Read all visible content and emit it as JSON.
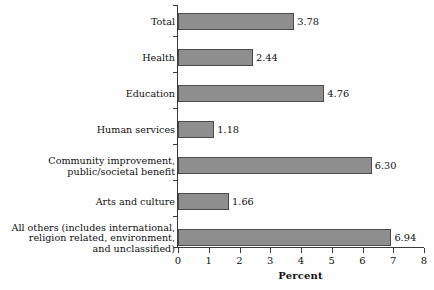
{
  "chart_data": {
    "type": "bar",
    "orientation": "horizontal",
    "title": "",
    "xlabel": "Percent",
    "ylabel": "",
    "xlim": [
      0,
      8
    ],
    "xticks": [
      0,
      1,
      2,
      3,
      4,
      5,
      6,
      7,
      8
    ],
    "xtick_labels": [
      "0",
      "1",
      "2",
      "3",
      "4",
      "5",
      "6",
      "7",
      "8"
    ],
    "grid": false,
    "legend": false,
    "bar_color": "#8e8e8e",
    "bar_edge_color": "#4a4a4a",
    "axis_color": "#3a3a3a",
    "background_color": "#fefefe",
    "categories": [
      "Total",
      "Health",
      "Education",
      "Human services",
      "Community improvement,\npublic/societal benefit",
      "Arts and culture",
      "All others (includes international,\nreligion related, environment,\nand unclassified)"
    ],
    "values": [
      3.78,
      2.44,
      4.76,
      1.18,
      6.3,
      1.66,
      6.94
    ],
    "value_labels": [
      "3.78",
      "2.44",
      "4.76",
      "1.18",
      "6.30",
      "1.66",
      "6.94"
    ]
  }
}
